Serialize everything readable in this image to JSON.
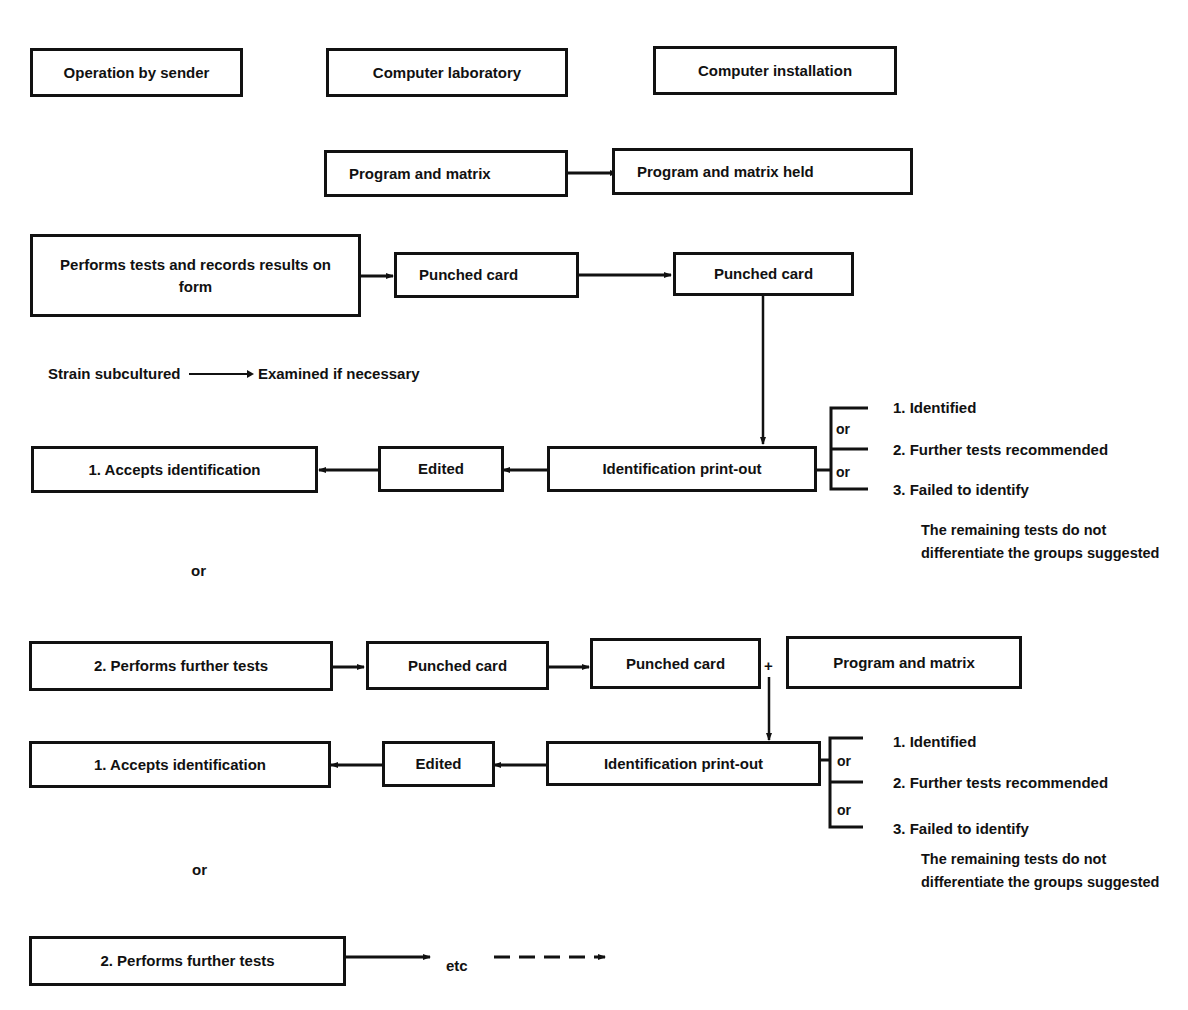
{
  "headers": {
    "sender": "Operation by sender",
    "laboratory": "Computer laboratory",
    "installation": "Computer installation"
  },
  "program_row": {
    "program": "Program and matrix",
    "held": "Program and matrix held"
  },
  "stage1": {
    "performs": "Performs tests and records results on form",
    "punched_card_1": "Punched card",
    "punched_card_2": "Punched card",
    "strain": "Strain subcultured",
    "examined": "Examined if necessary",
    "printout": "Identification print-out",
    "edited": "Edited",
    "accepts": "1.  Accepts identification",
    "or_label": "or",
    "outcomes": {
      "or1": "or",
      "or2": "or",
      "o1": "1.  Identified",
      "o2": "2.  Further tests recommended",
      "o3": "3.  Failed to identify",
      "note": "The remaining tests do not differentiate the groups suggested"
    }
  },
  "stage2": {
    "performs": "2.  Performs further tests",
    "punched_card_1": "Punched card",
    "punched_card_2": "Punched card",
    "plus": "+",
    "program": "Program and matrix",
    "printout": "Identification print-out",
    "edited": "Edited",
    "accepts": "1.  Accepts identification",
    "or_label": "or",
    "outcomes": {
      "or1": "or",
      "or2": "or",
      "o1": "1.  Identified",
      "o2": "2.  Further tests recommended",
      "o3": "3.  Failed to identify",
      "note": "The remaining tests do not differentiate the groups suggested"
    }
  },
  "stage3": {
    "performs": "2.  Performs further tests",
    "etc": "etc"
  }
}
